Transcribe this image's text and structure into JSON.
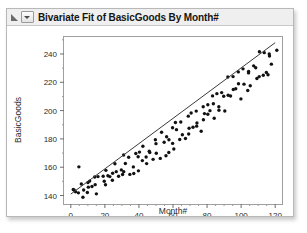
{
  "window": {
    "title": "Bivariate Fit of BasicGoods By Month#",
    "disclosure_icon": "disclosure-triangle-icon",
    "popup_icon": "popup-menu-icon"
  },
  "chart_data": {
    "type": "scatter",
    "title": "Bivariate Fit of BasicGoods By Month#",
    "xlabel": "Month#",
    "ylabel": "BasicGoods",
    "xlim": [
      -4,
      124
    ],
    "ylim": [
      134,
      252
    ],
    "xticks": [
      0,
      20,
      40,
      60,
      80,
      100,
      120
    ],
    "yticks": [
      140,
      160,
      180,
      200,
      220,
      240
    ],
    "grid": false,
    "legend": null,
    "series": [
      {
        "name": "BasicGoods",
        "marker": "filled-circle",
        "color": "#111111",
        "x": [
          1,
          2,
          3,
          4,
          5,
          6,
          7,
          8,
          9,
          10,
          11,
          12,
          13,
          14,
          15,
          16,
          17,
          18,
          19,
          20,
          21,
          22,
          23,
          24,
          25,
          26,
          27,
          28,
          29,
          30,
          31,
          32,
          33,
          34,
          35,
          36,
          37,
          38,
          39,
          40,
          41,
          42,
          43,
          44,
          45,
          46,
          47,
          48,
          49,
          50,
          51,
          52,
          53,
          54,
          55,
          56,
          57,
          58,
          59,
          60,
          61,
          62,
          63,
          64,
          65,
          66,
          67,
          68,
          69,
          70,
          71,
          72,
          73,
          74,
          75,
          76,
          77,
          78,
          79,
          80,
          81,
          82,
          83,
          84,
          85,
          86,
          87,
          88,
          89,
          90,
          91,
          92,
          93,
          94,
          95,
          96,
          97,
          98,
          99,
          100,
          101,
          102,
          103,
          104,
          105,
          106,
          107,
          108,
          109,
          110,
          111,
          112,
          113,
          114,
          115,
          116,
          117,
          118,
          119,
          120
        ],
        "y": [
          143,
          141,
          145,
          142,
          160,
          147,
          144,
          141,
          143,
          146,
          150,
          148,
          145,
          152,
          147,
          143,
          155,
          151,
          149,
          147,
          158,
          153,
          151,
          156,
          148,
          162,
          157,
          154,
          160,
          152,
          166,
          159,
          163,
          157,
          169,
          161,
          158,
          172,
          164,
          160,
          170,
          166,
          175,
          163,
          168,
          173,
          170,
          167,
          178,
          172,
          176,
          169,
          182,
          175,
          171,
          185,
          178,
          174,
          188,
          180,
          177,
          191,
          183,
          179,
          194,
          186,
          182,
          197,
          188,
          184,
          200,
          191,
          187,
          203,
          194,
          190,
          206,
          197,
          193,
          209,
          200,
          196,
          212,
          203,
          199,
          215,
          206,
          202,
          218,
          209,
          205,
          221,
          212,
          208,
          224,
          215,
          211,
          227,
          218,
          214,
          230,
          221,
          217,
          233,
          224,
          220,
          236,
          227,
          223,
          239,
          230,
          226,
          242,
          233,
          229,
          245,
          236,
          232,
          248,
          239
        ]
      }
    ],
    "fit": {
      "name": "Linear Fit",
      "type": "line",
      "color": "#3a3a3a",
      "x": [
        0,
        120
      ],
      "y": [
        141,
        248
      ]
    }
  }
}
